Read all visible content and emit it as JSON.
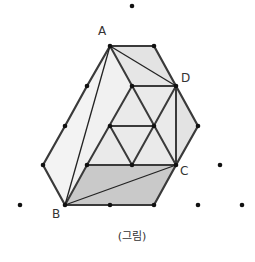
{
  "figure": {
    "caption": "(그림)",
    "labels": {
      "A": "A",
      "B": "B",
      "C": "C",
      "D": "D"
    },
    "colors": {
      "line": "#3a3a3a",
      "dot": "#111111",
      "fill_light": "#f3f3f3",
      "fill_mid": "#e9e9e9",
      "fill_upper": "#e3e3e3",
      "fill_dark": "#c9c9c9"
    },
    "grid_points": [
      [
        132,
        6
      ],
      [
        110,
        46
      ],
      [
        154,
        46
      ],
      [
        87,
        86
      ],
      [
        132,
        86
      ],
      [
        176,
        86
      ],
      [
        65,
        126
      ],
      [
        110,
        126
      ],
      [
        154,
        126
      ],
      [
        198,
        126
      ],
      [
        43,
        165
      ],
      [
        87,
        165
      ],
      [
        132,
        165
      ],
      [
        176,
        165
      ],
      [
        220,
        165
      ],
      [
        20,
        205
      ],
      [
        65,
        205
      ],
      [
        110,
        205
      ],
      [
        154,
        205
      ],
      [
        198,
        205
      ],
      [
        242,
        205
      ]
    ]
  }
}
